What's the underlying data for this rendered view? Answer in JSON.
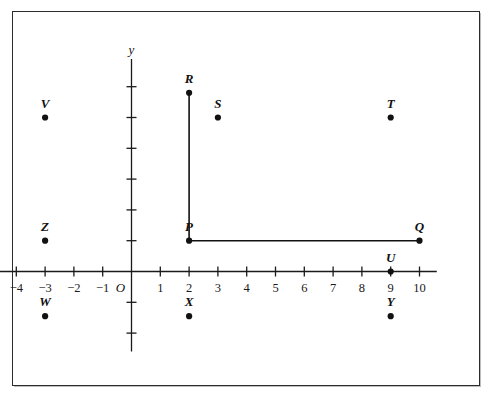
{
  "figure": {
    "kind": "coordinate-plane-diagram",
    "background_color": "#ffffff",
    "frame_color": "#2c2c2c",
    "axis_color": "#1a1a1a",
    "point_color": "#111111",
    "segment_color": "#111111"
  },
  "axes": {
    "x_axis_name": "",
    "y_axis_name": "y",
    "origin_label": "O",
    "x_tick_labels": [
      "−4",
      "−3",
      "−2",
      "−1",
      "1",
      "2",
      "3",
      "4",
      "5",
      "6",
      "7",
      "8",
      "9",
      "10"
    ],
    "x_tick_values": [
      -4,
      -3,
      -2,
      -1,
      1,
      2,
      3,
      4,
      5,
      6,
      7,
      8,
      9,
      10
    ],
    "x_range": [
      -4.6,
      10.6
    ],
    "y_tick_values": [
      1,
      2,
      3,
      4,
      5,
      6,
      -1,
      -2
    ],
    "y_tick_labels": [],
    "y_range": [
      -2.6,
      6.9
    ],
    "grid": "none"
  },
  "points": [
    {
      "label": "V",
      "x": -3,
      "y": 5
    },
    {
      "label": "Z",
      "x": -3,
      "y": 1
    },
    {
      "label": "W",
      "x": -3,
      "y": -1.45
    },
    {
      "label": "R",
      "x": 2,
      "y": 5.8
    },
    {
      "label": "S",
      "x": 3,
      "y": 5
    },
    {
      "label": "P",
      "x": 2,
      "y": 1
    },
    {
      "label": "X",
      "x": 2,
      "y": -1.45
    },
    {
      "label": "T",
      "x": 9,
      "y": 5
    },
    {
      "label": "Q",
      "x": 10,
      "y": 1
    },
    {
      "label": "U",
      "x": 9,
      "y": 0
    },
    {
      "label": "Y",
      "x": 9,
      "y": -1.45
    }
  ],
  "segments": [
    {
      "name": "segment-PR",
      "from": "P",
      "to": "R",
      "x1": 2,
      "y1": 1,
      "x2": 2,
      "y2": 5.8
    },
    {
      "name": "segment-PQ",
      "from": "P",
      "to": "Q",
      "x1": 2,
      "y1": 1,
      "x2": 10,
      "y2": 1
    }
  ]
}
